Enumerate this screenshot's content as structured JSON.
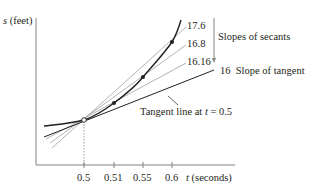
{
  "figure": {
    "y_axis_label_var": "s",
    "y_axis_label_unit": "(feet)",
    "x_axis_label_var": "t",
    "x_axis_label_unit": "(seconds)",
    "x_ticks": [
      "0.5",
      "0.51",
      "0.55",
      "0.6"
    ],
    "secant_slopes": [
      "17.6",
      "16.8",
      "16.16"
    ],
    "secant_bracket_label": "Slopes of secants",
    "tangent_slope": "16",
    "tangent_slope_label": "Slope of tangent",
    "tangent_annotation_prefix": "Tangent line at ",
    "tangent_annotation_var": "t",
    "tangent_annotation_suffix": " = 0.5",
    "colors": {
      "curve": "#231f20",
      "tangent": "#231f20",
      "secant": "#a7a9ac",
      "axis": "#808285"
    }
  }
}
